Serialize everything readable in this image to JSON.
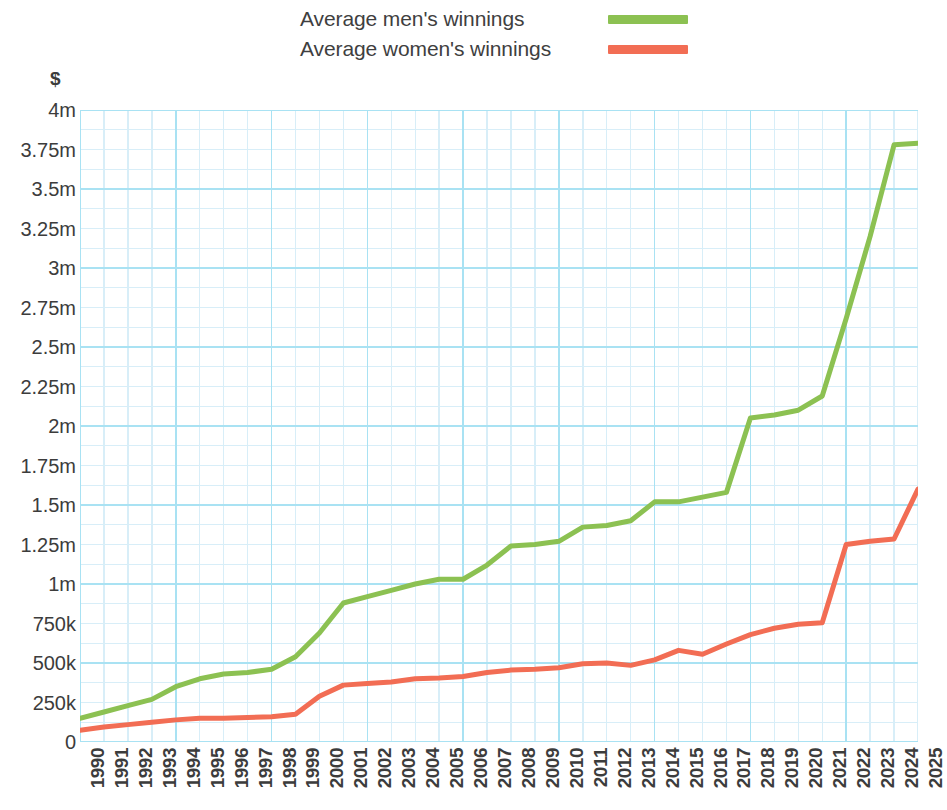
{
  "legend": {
    "items": [
      {
        "label": "Average men's winnings",
        "color": "#8cc152",
        "key": "men"
      },
      {
        "label": "Average women's winnings",
        "color": "#f26d54",
        "key": "women"
      }
    ]
  },
  "axes": {
    "y_title": "$",
    "y_ticks": [
      "4m",
      "3.75m",
      "3.5m",
      "3.25m",
      "3m",
      "2.75m",
      "2.5m",
      "2.25m",
      "2m",
      "1.75m",
      "1.5m",
      "1.25m",
      "1m",
      "750k",
      "500k",
      "250k",
      "0"
    ],
    "y_tick_values": [
      4000000,
      3750000,
      3500000,
      3250000,
      3000000,
      2750000,
      2500000,
      2250000,
      2000000,
      1750000,
      1500000,
      1250000,
      1000000,
      750000,
      500000,
      250000,
      0
    ]
  },
  "style": {
    "grid_major_color": "#a9e2f3",
    "grid_minor_color": "#d8eef8",
    "plot_bg": "#ffffff",
    "text_color": "#3c3c3c"
  },
  "chart_data": {
    "type": "line",
    "title": "",
    "subtitle": "",
    "xlabel": "",
    "ylabel": "$",
    "ylim": [
      0,
      4000000
    ],
    "grid": true,
    "legend_position": "top",
    "x": [
      1990,
      1991,
      1992,
      1993,
      1994,
      1995,
      1996,
      1997,
      1998,
      1999,
      2000,
      2001,
      2002,
      2003,
      2004,
      2005,
      2006,
      2007,
      2008,
      2009,
      2010,
      2011,
      2012,
      2013,
      2014,
      2015,
      2016,
      2017,
      2018,
      2019,
      2020,
      2021,
      2022,
      2023,
      2024,
      2025
    ],
    "categories": [
      "1990",
      "1991",
      "1992",
      "1993",
      "1994",
      "1995",
      "1996",
      "1997",
      "1998",
      "1999",
      "2000",
      "2001",
      "2002",
      "2003",
      "2004",
      "2005",
      "2006",
      "2007",
      "2008",
      "2009",
      "2010",
      "2011",
      "2012",
      "2013",
      "2014",
      "2015",
      "2016",
      "2017",
      "2018",
      "2019",
      "2020",
      "2021",
      "2022",
      "2023",
      "2024",
      "2025"
    ],
    "series": [
      {
        "name": "Average men's winnings",
        "color": "#8cc152",
        "values": [
          150000,
          190000,
          230000,
          270000,
          350000,
          400000,
          430000,
          440000,
          460000,
          540000,
          690000,
          880000,
          920000,
          960000,
          1000000,
          1030000,
          1030000,
          1120000,
          1240000,
          1250000,
          1270000,
          1360000,
          1370000,
          1400000,
          1520000,
          1520000,
          1550000,
          1580000,
          2050000,
          2070000,
          2100000,
          2190000,
          2680000,
          3200000,
          3780000,
          3790000
        ]
      },
      {
        "name": "Average women's winnings",
        "color": "#f26d54",
        "values": [
          75000,
          95000,
          110000,
          125000,
          140000,
          150000,
          150000,
          155000,
          160000,
          175000,
          290000,
          360000,
          370000,
          380000,
          400000,
          405000,
          415000,
          440000,
          455000,
          460000,
          470000,
          495000,
          500000,
          485000,
          520000,
          580000,
          555000,
          620000,
          680000,
          720000,
          745000,
          755000,
          1250000,
          1270000,
          1285000,
          1600000
        ]
      }
    ]
  }
}
